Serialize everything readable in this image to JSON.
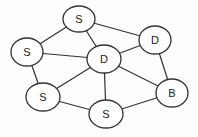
{
  "diagram": {
    "type": "network-graph",
    "nodes": [
      {
        "id": "n1",
        "label": "S",
        "cx": 79,
        "cy": 19,
        "rx": 16,
        "ry": 13
      },
      {
        "id": "n2",
        "label": "D",
        "cx": 155,
        "cy": 40,
        "rx": 16,
        "ry": 14
      },
      {
        "id": "n3",
        "label": "S",
        "cx": 27,
        "cy": 52,
        "rx": 16,
        "ry": 14
      },
      {
        "id": "n4",
        "label": "D",
        "cx": 104,
        "cy": 59,
        "rx": 17,
        "ry": 14
      },
      {
        "id": "n5",
        "label": "S",
        "cx": 43,
        "cy": 97,
        "rx": 17,
        "ry": 14
      },
      {
        "id": "n6",
        "label": "B",
        "cx": 172,
        "cy": 93,
        "rx": 16,
        "ry": 14
      },
      {
        "id": "n7",
        "label": "S",
        "cx": 106,
        "cy": 114,
        "rx": 17,
        "ry": 14
      }
    ],
    "edges": [
      [
        "n1",
        "n2"
      ],
      [
        "n1",
        "n3"
      ],
      [
        "n1",
        "n4"
      ],
      [
        "n2",
        "n4"
      ],
      [
        "n2",
        "n6"
      ],
      [
        "n3",
        "n4"
      ],
      [
        "n3",
        "n5"
      ],
      [
        "n4",
        "n5"
      ],
      [
        "n4",
        "n6"
      ],
      [
        "n4",
        "n7"
      ],
      [
        "n5",
        "n7"
      ],
      [
        "n7",
        "n6"
      ]
    ]
  }
}
